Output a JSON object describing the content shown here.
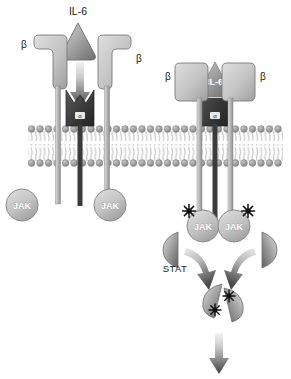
{
  "figure": {
    "width": 291,
    "height": 379,
    "background": "#ffffff"
  },
  "labels": {
    "ligand_free": "IL-6",
    "ligand_bound": "IL-6",
    "beta_left_unbound": "β",
    "beta_right_unbound": "β",
    "beta_left_bound": "β",
    "beta_right_bound": "β",
    "alpha_unbound": "α",
    "alpha_bound": "α",
    "jak_1": "JAK",
    "jak_2": "JAK",
    "jak_3": "JAK",
    "jak_4": "JAK",
    "stat": "STAT"
  },
  "colors": {
    "ligand_fill_light": "#b9b9b9",
    "ligand_fill_dark": "#7a7a7a",
    "receptor_beta_light": "#d2d2d2",
    "receptor_beta_dark": "#a8a8a8",
    "receptor_alpha_dark": "#4a4a4a",
    "receptor_alpha_darker": "#2e2e2e",
    "membrane_head": "#9a9a9a",
    "membrane_tail": "#cfcfcf",
    "jak_fill": "#c2c2c2",
    "jak_stroke": "#8d8d8d",
    "stat_light": "#d8d8d8",
    "stat_dark": "#6e6e6e",
    "arrow_dark": "#4d4d4d",
    "arrow_light": "#ededed",
    "phosphate": "#111111",
    "text": "#1a1a1a",
    "text_inverse": "#ffffff",
    "outline": "#6f6f6f"
  },
  "diagram": {
    "type": "cell-signaling-pathway",
    "membrane": {
      "name": "plasma-membrane",
      "x_start": 28,
      "x_end": 283,
      "top_y": 126,
      "bottom_y": 162,
      "lipid_count": 30,
      "style": "phospholipid-bilayer"
    },
    "panels": [
      {
        "name": "unbound-receptor-panel",
        "description": "Resting state: free IL-6 ligand above, separated beta receptor chains and alpha receptor in membrane, inactive JAK kinases"
      },
      {
        "name": "bound-receptor-panel",
        "description": "Activated state: IL-6 bound in alpha receptor cradle, beta chains dimerized, JAK kinases phosphorylated, STAT recruited and dimerized"
      }
    ],
    "elements": {
      "free_ligand": {
        "cx": 78,
        "cy": 42,
        "shape": "rounded-triangle"
      },
      "activation_arrow": {
        "x": 80,
        "y_start": 62,
        "y_end": 108
      },
      "alpha_unbound": {
        "cx": 80,
        "cy": 105
      },
      "beta_left_unbound": {
        "cx": 47,
        "cy": 64
      },
      "beta_right_unbound": {
        "cx": 117,
        "cy": 64
      },
      "jak_left": {
        "cx": 22,
        "cy": 205
      },
      "jak_mid": {
        "cx": 110,
        "cy": 205
      },
      "bound_complex": {
        "cx": 215,
        "cy": 90
      },
      "jak_active_left": {
        "cx": 203,
        "cy": 226
      },
      "jak_active_right": {
        "cx": 234,
        "cy": 226
      },
      "stat_monomer_left": {
        "cx": 172,
        "cy": 247
      },
      "stat_monomer_right": {
        "cx": 268,
        "cy": 247
      },
      "stat_dimer": {
        "cx": 222,
        "cy": 302
      },
      "output_arrow": {
        "x": 219,
        "y_start": 330,
        "y_end": 372
      }
    }
  }
}
